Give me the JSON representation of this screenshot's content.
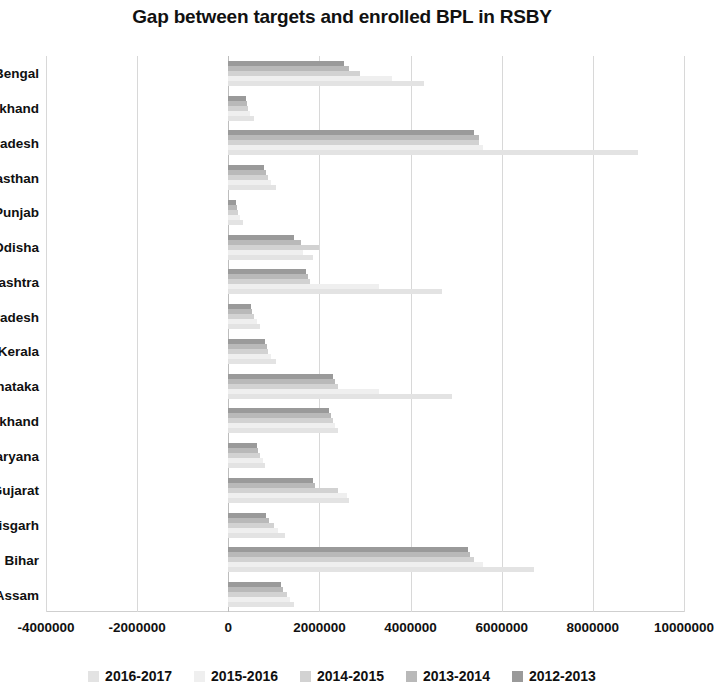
{
  "chart_data": {
    "type": "bar",
    "orientation": "horizontal",
    "title": "Gap between targets and enrolled BPL in RSBY",
    "xlabel": "",
    "ylabel": "",
    "xlim": [
      -4000000,
      10000000
    ],
    "xticks": [
      "-4000000",
      "-2000000",
      "0",
      "2000000",
      "4000000",
      "6000000",
      "8000000",
      "10000000"
    ],
    "xtick_values": [
      -4000000,
      -2000000,
      0,
      2000000,
      4000000,
      6000000,
      8000000,
      10000000
    ],
    "grid": true,
    "legend_position": "bottom",
    "categories": [
      "West Bengal",
      "Uttarakhand",
      "Uttar Pradesh",
      "Rajasthan",
      "Punjab",
      "Odisha",
      "Maharashtra",
      "Madhya Pradesh",
      "Kerala",
      "Karnataka",
      "Jharkhand",
      "Haryana",
      "Gujarat",
      "Chhattisgarh",
      "Bihar",
      "Assam"
    ],
    "series": [
      {
        "name": "2016-2017",
        "color": "#e3e3e3",
        "values": [
          4300000,
          560000,
          9000000,
          1050000,
          330000,
          1850000,
          4700000,
          700000,
          1050000,
          4900000,
          2400000,
          800000,
          2650000,
          1250000,
          6700000,
          1450000
        ]
      },
      {
        "name": "2015-2016",
        "color": "#efefef",
        "values": [
          3600000,
          480000,
          5600000,
          930000,
          250000,
          1650000,
          3300000,
          620000,
          930000,
          3300000,
          2350000,
          760000,
          2600000,
          1100000,
          5600000,
          1350000
        ]
      },
      {
        "name": "2014-2015",
        "color": "#d2d2d2",
        "values": [
          2900000,
          430000,
          5500000,
          880000,
          210000,
          2000000,
          1800000,
          560000,
          880000,
          2400000,
          2300000,
          700000,
          2400000,
          1000000,
          5400000,
          1280000
        ]
      },
      {
        "name": "2013-2014",
        "color": "#b9b9b9",
        "values": [
          2650000,
          400000,
          5500000,
          820000,
          190000,
          1600000,
          1750000,
          520000,
          840000,
          2350000,
          2250000,
          660000,
          1900000,
          900000,
          5300000,
          1200000
        ]
      },
      {
        "name": "2012-2013",
        "color": "#9a9a9a",
        "values": [
          2550000,
          380000,
          5400000,
          780000,
          170000,
          1450000,
          1700000,
          500000,
          800000,
          2300000,
          2200000,
          620000,
          1850000,
          820000,
          5250000,
          1150000
        ]
      }
    ]
  }
}
